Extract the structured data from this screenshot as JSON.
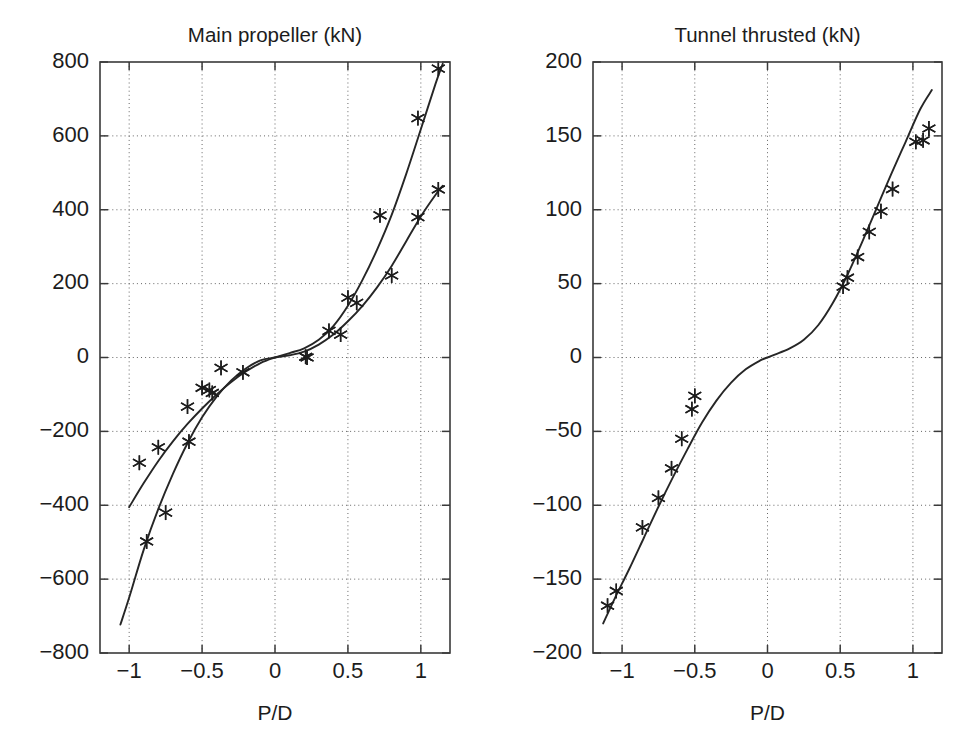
{
  "figure": {
    "background": "#ffffff",
    "line_color": "#262626",
    "grid_color": "#555555",
    "marker_symbol": "asterisk",
    "width": 979,
    "height": 731
  },
  "chart_data": [
    {
      "type": "line",
      "id": "main-propeller",
      "title": "Main propeller (kN)",
      "xlabel": "P/D",
      "ylabel": "",
      "xlim": [
        -1.2,
        1.2
      ],
      "ylim": [
        -800,
        800
      ],
      "xticks": [
        -1,
        -0.5,
        0,
        0.5,
        1
      ],
      "xticklabels": [
        "−1",
        "−0.5",
        "0",
        "0.5",
        "1"
      ],
      "yticks": [
        -800,
        -600,
        -400,
        -200,
        0,
        200,
        400,
        600,
        800
      ],
      "yticklabels": [
        "−800",
        "−600",
        "−400",
        "−200",
        "0",
        "200",
        "400",
        "600",
        "800"
      ],
      "grid": true,
      "grid_style": "dotted",
      "legend": null,
      "series": [
        {
          "name": "curve-upper",
          "style": "solid-line",
          "x": [
            -1.0,
            -0.9,
            -0.8,
            -0.7,
            -0.6,
            -0.5,
            -0.4,
            -0.3,
            -0.2,
            -0.1,
            0.0,
            0.1,
            0.2,
            0.3,
            0.4,
            0.5,
            0.6,
            0.7,
            0.8,
            0.9,
            1.0,
            1.1,
            1.15
          ],
          "y": [
            -405,
            -340,
            -280,
            -227,
            -180,
            -138,
            -100,
            -66,
            -38,
            -15,
            0,
            12,
            25,
            48,
            85,
            140,
            210,
            292,
            386,
            497,
            618,
            740,
            795
          ]
        },
        {
          "name": "curve-lower",
          "style": "solid-line",
          "x": [
            -1.06,
            -1.0,
            -0.9,
            -0.8,
            -0.7,
            -0.6,
            -0.5,
            -0.4,
            -0.3,
            -0.2,
            -0.1,
            0.0,
            0.1,
            0.2,
            0.3,
            0.4,
            0.5,
            0.6,
            0.7,
            0.8,
            0.9,
            1.0,
            1.1,
            1.15
          ],
          "y": [
            -723,
            -650,
            -520,
            -410,
            -315,
            -232,
            -162,
            -106,
            -62,
            -30,
            -8,
            0,
            6,
            16,
            35,
            62,
            98,
            140,
            190,
            248,
            315,
            382,
            440,
            465
          ]
        }
      ],
      "markers": [
        {
          "series": "curve-upper",
          "x": -0.93,
          "y": -285
        },
        {
          "series": "curve-upper",
          "x": -0.8,
          "y": -243
        },
        {
          "series": "curve-upper",
          "x": -0.6,
          "y": -133
        },
        {
          "series": "curve-upper",
          "x": -0.5,
          "y": -82
        },
        {
          "series": "curve-upper",
          "x": -0.45,
          "y": -88
        },
        {
          "series": "curve-upper",
          "x": -0.37,
          "y": -28
        },
        {
          "series": "curve-upper",
          "x": -0.22,
          "y": -40
        },
        {
          "series": "curve-upper",
          "x": 0.21,
          "y": 2
        },
        {
          "series": "curve-upper",
          "x": 0.37,
          "y": 72
        },
        {
          "series": "curve-upper",
          "x": 0.5,
          "y": 162
        },
        {
          "series": "curve-upper",
          "x": 0.72,
          "y": 385
        },
        {
          "series": "curve-upper",
          "x": 0.98,
          "y": 648
        },
        {
          "series": "curve-upper",
          "x": 1.12,
          "y": 782
        },
        {
          "series": "curve-lower",
          "x": -0.88,
          "y": -498
        },
        {
          "series": "curve-lower",
          "x": -0.75,
          "y": -420
        },
        {
          "series": "curve-lower",
          "x": -0.59,
          "y": -228
        },
        {
          "series": "curve-lower",
          "x": -0.43,
          "y": -96
        },
        {
          "series": "curve-lower",
          "x": 0.22,
          "y": 0
        },
        {
          "series": "curve-lower",
          "x": 0.45,
          "y": 62
        },
        {
          "series": "curve-lower",
          "x": 0.56,
          "y": 148
        },
        {
          "series": "curve-lower",
          "x": 0.8,
          "y": 222
        },
        {
          "series": "curve-lower",
          "x": 0.98,
          "y": 380
        },
        {
          "series": "curve-lower",
          "x": 1.12,
          "y": 455
        }
      ]
    },
    {
      "type": "line",
      "id": "tunnel-thruster",
      "title": "Tunnel thrusted (kN)",
      "xlabel": "P/D",
      "ylabel": "",
      "xlim": [
        -1.2,
        1.2
      ],
      "ylim": [
        -200,
        200
      ],
      "xticks": [
        -1,
        -0.5,
        0,
        0.5,
        1
      ],
      "xticklabels": [
        "−1",
        "−0.5",
        "0",
        "0.5",
        "1"
      ],
      "yticks": [
        -200,
        -150,
        -100,
        -50,
        0,
        50,
        100,
        150,
        200
      ],
      "yticklabels": [
        "−200",
        "−150",
        "−100",
        "−50",
        "0",
        "50",
        "100",
        "150",
        "200"
      ],
      "grid": true,
      "grid_style": "dotted",
      "legend": null,
      "series": [
        {
          "name": "curve",
          "style": "solid-line",
          "x": [
            -1.13,
            -1.05,
            -0.95,
            -0.85,
            -0.75,
            -0.65,
            -0.55,
            -0.45,
            -0.35,
            -0.25,
            -0.15,
            -0.05,
            0.0,
            0.05,
            0.15,
            0.25,
            0.35,
            0.45,
            0.55,
            0.65,
            0.75,
            0.85,
            0.95,
            1.05,
            1.13
          ],
          "y": [
            -180,
            -163,
            -143,
            -122,
            -101,
            -81,
            -62,
            -44,
            -29,
            -17,
            -8,
            -2,
            0,
            2,
            6,
            12,
            22,
            37,
            56,
            78,
            101,
            124,
            146,
            168,
            181
          ]
        }
      ],
      "markers": [
        {
          "series": "curve",
          "x": -1.1,
          "y": -168
        },
        {
          "series": "curve",
          "x": -1.04,
          "y": -158
        },
        {
          "series": "curve",
          "x": -0.86,
          "y": -115
        },
        {
          "series": "curve",
          "x": -0.75,
          "y": -95
        },
        {
          "series": "curve",
          "x": -0.66,
          "y": -75
        },
        {
          "series": "curve",
          "x": -0.59,
          "y": -55
        },
        {
          "series": "curve",
          "x": -0.52,
          "y": -35
        },
        {
          "series": "curve",
          "x": -0.5,
          "y": -26
        },
        {
          "series": "curve",
          "x": 0.52,
          "y": 48
        },
        {
          "series": "curve",
          "x": 0.55,
          "y": 54
        },
        {
          "series": "curve",
          "x": 0.62,
          "y": 68
        },
        {
          "series": "curve",
          "x": 0.7,
          "y": 85
        },
        {
          "series": "curve",
          "x": 0.78,
          "y": 99
        },
        {
          "series": "curve",
          "x": 0.86,
          "y": 114
        },
        {
          "series": "curve",
          "x": 1.02,
          "y": 146
        },
        {
          "series": "curve",
          "x": 1.07,
          "y": 147
        },
        {
          "series": "curve",
          "x": 1.11,
          "y": 155
        }
      ]
    }
  ]
}
